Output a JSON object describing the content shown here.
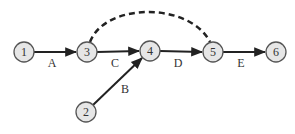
{
  "diagram": {
    "type": "activity-on-arrow network",
    "nodes": [
      {
        "id": "1",
        "label": "1",
        "x": 24,
        "y": 52
      },
      {
        "id": "2",
        "label": "2",
        "x": 86,
        "y": 112
      },
      {
        "id": "3",
        "label": "3",
        "x": 87,
        "y": 52
      },
      {
        "id": "4",
        "label": "4",
        "x": 150,
        "y": 51
      },
      {
        "id": "5",
        "label": "5",
        "x": 213,
        "y": 52
      },
      {
        "id": "6",
        "label": "6",
        "x": 276,
        "y": 52
      }
    ],
    "edges": [
      {
        "from": "1",
        "to": "3",
        "label": "A",
        "style": "solid"
      },
      {
        "from": "2",
        "to": "4",
        "label": "B",
        "style": "solid"
      },
      {
        "from": "3",
        "to": "4",
        "label": "C",
        "style": "solid"
      },
      {
        "from": "4",
        "to": "5",
        "label": "D",
        "style": "solid"
      },
      {
        "from": "5",
        "to": "6",
        "label": "E",
        "style": "solid"
      },
      {
        "from": "3",
        "to": "5",
        "label": "",
        "style": "dashed"
      }
    ],
    "edge_labels": {
      "A": "A",
      "B": "B",
      "C": "C",
      "D": "D",
      "E": "E"
    }
  }
}
